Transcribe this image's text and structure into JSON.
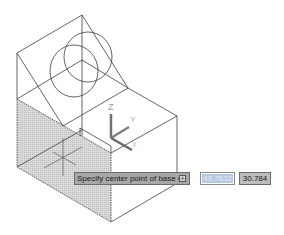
{
  "app": {
    "type": "CAD drawing viewport"
  },
  "viewport": {
    "model": "isometric block with inclined face and cylinder",
    "ucs_icon": {
      "axes": [
        "Z",
        "Y",
        "X"
      ]
    },
    "shaded_face_color": "#d2d2d2",
    "line_color": "#3c3c3c"
  },
  "dynamic_input": {
    "prompt": "Specify center point of base or",
    "expand_glyph": "+",
    "x_value": "49.7632",
    "y_value": "30.784"
  }
}
